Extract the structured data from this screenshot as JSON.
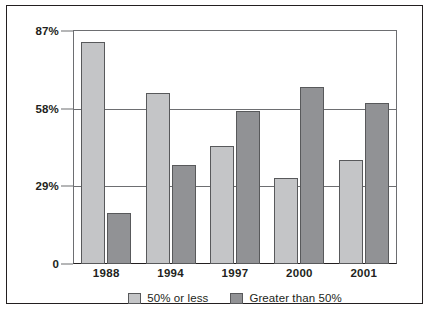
{
  "chart_data": {
    "type": "bar",
    "title": "",
    "subtitle": "",
    "xlabel": "",
    "ylabel": "",
    "categories": [
      "1988",
      "1994",
      "1997",
      "2000",
      "2001"
    ],
    "series": [
      {
        "name": "50% or less",
        "color": "#c4c5c7",
        "values": [
          83,
          64,
          44,
          32,
          39
        ]
      },
      {
        "name": "Greater than 50%",
        "color": "#919295",
        "values": [
          19,
          37,
          57,
          66,
          60
        ]
      }
    ],
    "ylim": [
      0,
      87
    ],
    "yticks": [
      0,
      29,
      58,
      87
    ],
    "ytick_labels": [
      "0",
      "29%",
      "58%",
      "87%"
    ],
    "grid": true,
    "legend_position": "bottom"
  },
  "legend": {
    "items": [
      {
        "label": "50% or less",
        "swatch": "light"
      },
      {
        "label": "Greater than 50%",
        "swatch": "dark"
      }
    ]
  }
}
